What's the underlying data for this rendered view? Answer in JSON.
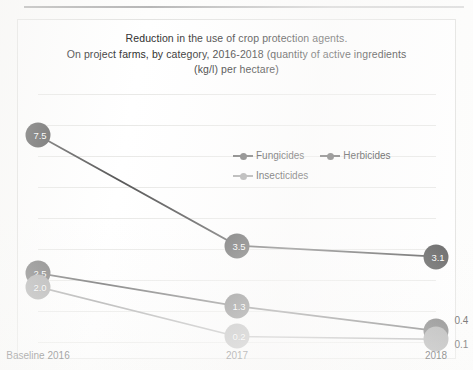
{
  "chart_data": {
    "type": "line",
    "title": "Reduction in the use of crop protection agents. On project farms, by category, 2016-2018 (quantity of active ingredients (kg/l) per hectare)",
    "title_lines": [
      "Reduction in the use of crop protection agents.",
      "On project farms, by category, 2016-2018 (quantity of active ingredients",
      "(kg/l) per hectare)"
    ],
    "categories": [
      "Baseline 2016",
      "2017",
      "2018"
    ],
    "series": [
      {
        "name": "Fungicides",
        "values": [
          2.5,
          1.3,
          0.4
        ],
        "labels": [
          "2.5",
          "1.3",
          "0.4"
        ],
        "color": "#6b6b6b"
      },
      {
        "name": "Herbicides",
        "values": [
          7.5,
          3.5,
          3.1
        ],
        "labels": [
          "7.5",
          "3.5",
          "3.1"
        ],
        "color": "#595959"
      },
      {
        "name": "Insecticides",
        "values": [
          2.0,
          0.2,
          0.1
        ],
        "labels": [
          "2.0",
          "0.2",
          "0.1"
        ],
        "color": "#a6a6a6"
      }
    ],
    "xlabel": "",
    "ylabel": "",
    "ylim": [
      0,
      9
    ],
    "grid": true,
    "gridlines": 9,
    "y_tick_labels_visible": false,
    "legend_position": "inside-upper-center",
    "legend": [
      "Fungicides",
      "Herbicides",
      "Insecticides"
    ]
  },
  "legend": {
    "row1": [
      "Fungicides",
      "Herbicides"
    ],
    "row2": [
      "Insecticides"
    ]
  },
  "axis": {
    "x_ticks": [
      "Baseline 2016",
      "2017",
      "2018"
    ]
  },
  "colors": {
    "fungicides": "#6b6b6b",
    "herbicides": "#595959",
    "insecticides": "#a6a6a6",
    "gridline": "#e9e9e7",
    "frame": "#e3e3e1",
    "text": "#2b2b2b"
  }
}
